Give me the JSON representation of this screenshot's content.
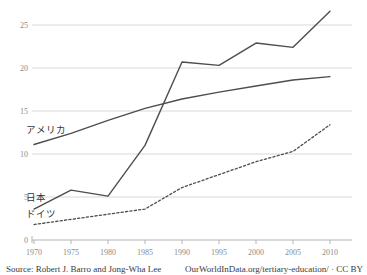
{
  "chart_data": {
    "type": "line",
    "title": "",
    "subtitle": "",
    "xlabel": "",
    "ylabel": "",
    "xlim": [
      1969,
      2011
    ],
    "ylim": [
      0,
      27.5
    ],
    "x": [
      1970,
      1975,
      1980,
      1985,
      1990,
      1995,
      2000,
      2005,
      2010
    ],
    "yticks": [
      "0",
      "5",
      "10",
      "15",
      "20",
      "25"
    ],
    "ytick_values": [
      0,
      5,
      10,
      15,
      20,
      25
    ],
    "xticks": [
      "1970",
      "1975",
      "1980",
      "1985",
      "1990",
      "1995",
      "2000",
      "2005",
      "2010"
    ],
    "grid": "horizontal",
    "legend": "inline-labels",
    "series": [
      {
        "name": "アメリカ",
        "label": "アメリカ",
        "style": "solid",
        "color": "#4d4d4d",
        "values": [
          11.1,
          12.4,
          13.9,
          15.3,
          16.4,
          17.2,
          17.9,
          18.6,
          19.0
        ]
      },
      {
        "name": "日本",
        "label": "日本",
        "style": "solid",
        "color": "#4d4d4d",
        "values": [
          3.6,
          5.8,
          5.1,
          11.0,
          20.7,
          20.3,
          22.9,
          22.4,
          26.6
        ]
      },
      {
        "name": "ドイツ",
        "label": "ドイツ",
        "style": "dashed",
        "color": "#4d4d4d",
        "values": [
          1.8,
          2.4,
          3.0,
          3.6,
          6.1,
          7.6,
          9.1,
          10.3,
          13.4
        ]
      }
    ]
  },
  "labels": {
    "america": "アメリカ",
    "japan": "日本",
    "germany": "ドイツ"
  },
  "yaxis": {
    "t0": "0",
    "t5": "5",
    "t10": "10",
    "t15": "15",
    "t20": "20",
    "t25": "25"
  },
  "xaxis": {
    "t1970": "1970",
    "t1975": "1975",
    "t1980": "1980",
    "t1985": "1985",
    "t1990": "1990",
    "t1995": "1995",
    "t2000": "2000",
    "t2005": "2005",
    "t2010": "2010"
  },
  "footer": {
    "source": "Source: Robert J. Barro and Jong-Wha Lee",
    "credit": "OurWorldInData.org/tertiary-education/ · CC BY"
  },
  "colors": {
    "line": "#4d4d4d",
    "grid": "#d8d8d8",
    "axis": "#b5b5b5",
    "tick_text": "#8a8a8a",
    "body_text": "#3a3a3a",
    "background": "#ffffff"
  }
}
